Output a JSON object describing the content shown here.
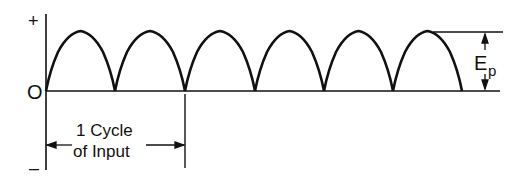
{
  "diagram": {
    "type": "full-wave rectified waveform",
    "axis_labels": {
      "positive": "+",
      "zero": "O",
      "negative": "–"
    },
    "peak_label_main": "E",
    "peak_label_sub": "p",
    "cycle_label_line1": "1 Cycle",
    "cycle_label_line2": "of Input",
    "num_half_cycles": 6,
    "colors": {
      "line": "#111111",
      "background": "#ffffff"
    }
  }
}
